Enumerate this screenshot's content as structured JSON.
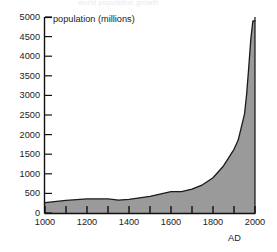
{
  "figure": {
    "cropped_title": "world population growth",
    "y_axis_caption": "population (millions)",
    "x_axis_caption": "AD"
  },
  "chart_data": {
    "type": "area",
    "title": "population (millions)",
    "xlabel": "AD",
    "ylabel": "population (millions)",
    "xlim": [
      1000,
      2000
    ],
    "ylim": [
      0,
      5000
    ],
    "grid": false,
    "legend": null,
    "fill_color": "#9a9a9a",
    "line_color": "#1a1a1a",
    "y_ticks": [
      0,
      500,
      1000,
      1500,
      2000,
      2500,
      3000,
      3500,
      4000,
      4500,
      5000
    ],
    "y_tick_labels": [
      "0",
      "500",
      "1000",
      "1500",
      "2000",
      "2500",
      "3000",
      "3500",
      "4000",
      "4500",
      "5000"
    ],
    "x_ticks": [
      1000,
      1100,
      1200,
      1300,
      1400,
      1500,
      1600,
      1700,
      1800,
      1900,
      2000
    ],
    "x_tick_labels_major": [
      "1000",
      "1200",
      "1400",
      "1600",
      "1800",
      "2000"
    ],
    "x_major": [
      1000,
      1200,
      1400,
      1600,
      1800,
      2000
    ],
    "x_minor": [
      1100,
      1300,
      1500,
      1700,
      1900
    ],
    "x": [
      1000,
      1100,
      1200,
      1300,
      1350,
      1400,
      1500,
      1600,
      1650,
      1700,
      1750,
      1800,
      1850,
      1900,
      1920,
      1950,
      1960,
      1970,
      1980,
      1990,
      2000
    ],
    "values": [
      265,
      320,
      360,
      360,
      330,
      350,
      425,
      545,
      545,
      610,
      720,
      900,
      1200,
      1625,
      1860,
      2520,
      3020,
      3700,
      4430,
      4900,
      4900
    ],
    "series_name": "world population"
  }
}
